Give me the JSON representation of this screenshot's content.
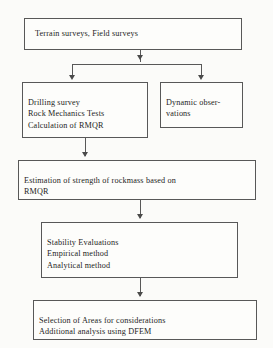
{
  "diagram": {
    "background_color": "#fbfbf9",
    "border_color": "#585858",
    "text_color": "#1d1d1d",
    "nodes": [
      {
        "id": "top",
        "text": "Terrain surveys, Field surveys"
      },
      {
        "id": "left",
        "text": "Drilling survey\nRock Mechanics Tests\nCalculation of RMQR"
      },
      {
        "id": "right",
        "text": "Dynamic obser-\nvations"
      },
      {
        "id": "estimation",
        "text": "Estimation of strength of rockmass based on\nRMQR"
      },
      {
        "id": "stability",
        "text": "Stability Evaluations\nEmpirical method\nAnalytical method"
      },
      {
        "id": "selection",
        "text": "Selection of Areas for considerations\nAdditional analysis using DFEM"
      }
    ],
    "connectors": [
      {
        "id": "top-to-split",
        "from": "top",
        "to": "split-bar"
      },
      {
        "id": "split-to-left",
        "from": "split-bar",
        "to": "left"
      },
      {
        "id": "split-to-right",
        "from": "split-bar",
        "to": "right"
      },
      {
        "id": "left-to-estimation",
        "from": "left",
        "to": "estimation"
      },
      {
        "id": "estimation-to-stability",
        "from": "estimation",
        "to": "stability"
      },
      {
        "id": "stability-to-selection",
        "from": "stability",
        "to": "selection"
      }
    ]
  }
}
